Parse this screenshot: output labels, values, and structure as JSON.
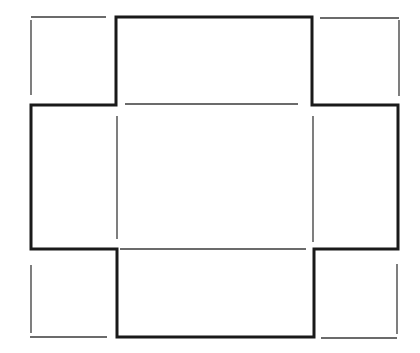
{
  "diagram": {
    "colors": {
      "background": "#ffffff",
      "outline": "#1a1a1a",
      "fold_line": "#3a3a3a"
    },
    "outline_path": [
      [
        116,
        17
      ],
      [
        312,
        17
      ],
      [
        312,
        105
      ],
      [
        398,
        105
      ],
      [
        398,
        249
      ],
      [
        314,
        249
      ],
      [
        314,
        337
      ],
      [
        117,
        337
      ],
      [
        117,
        249
      ],
      [
        31,
        249
      ],
      [
        31,
        105
      ],
      [
        116,
        105
      ],
      [
        116,
        17
      ]
    ],
    "fold_lines": [
      {
        "name": "top-left-corner-top",
        "x1": 31,
        "y1": 17,
        "x2": 106,
        "y2": 17
      },
      {
        "name": "top-left-corner-left",
        "x1": 31,
        "y1": 20,
        "x2": 31,
        "y2": 95
      },
      {
        "name": "top-right-corner-top",
        "x1": 320,
        "y1": 18,
        "x2": 399,
        "y2": 18
      },
      {
        "name": "top-right-corner-right",
        "x1": 399,
        "y1": 20,
        "x2": 399,
        "y2": 96
      },
      {
        "name": "inner-top-fold",
        "x1": 125,
        "y1": 104,
        "x2": 298,
        "y2": 104
      },
      {
        "name": "inner-bottom-fold",
        "x1": 120,
        "y1": 249,
        "x2": 306,
        "y2": 249
      },
      {
        "name": "inner-left-fold",
        "x1": 117,
        "y1": 116,
        "x2": 117,
        "y2": 239
      },
      {
        "name": "inner-right-fold",
        "x1": 313,
        "y1": 116,
        "x2": 313,
        "y2": 242
      },
      {
        "name": "bottom-left-corner-left",
        "x1": 31,
        "y1": 265,
        "x2": 31,
        "y2": 333
      },
      {
        "name": "bottom-left-corner-bottom",
        "x1": 30,
        "y1": 337,
        "x2": 107,
        "y2": 337
      },
      {
        "name": "bottom-right-corner-right",
        "x1": 397,
        "y1": 264,
        "x2": 397,
        "y2": 334
      },
      {
        "name": "bottom-right-corner-bottom",
        "x1": 321,
        "y1": 338,
        "x2": 397,
        "y2": 338
      }
    ]
  }
}
